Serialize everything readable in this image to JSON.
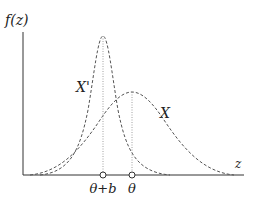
{
  "diagram": {
    "y_axis_label": "f(z)",
    "x_axis_label": "z",
    "curves": [
      {
        "name": "X'",
        "label": "X'",
        "peak_at": "θ+b",
        "style": "dashed",
        "relative_height": "tall, narrow"
      },
      {
        "name": "X",
        "label": "X",
        "peak_at": "θ",
        "style": "dashed",
        "relative_height": "short, wide"
      }
    ],
    "markers": [
      {
        "label": "θ+b",
        "position": "left"
      },
      {
        "label": "θ",
        "position": "right"
      }
    ],
    "colors": {
      "line": "#555555",
      "axis": "#333333"
    }
  }
}
